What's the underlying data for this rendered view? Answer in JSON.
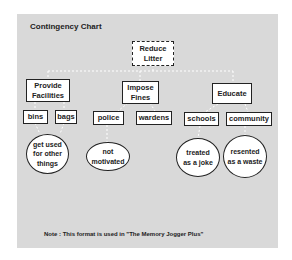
{
  "chart_title": "Contingency Chart",
  "root": {
    "label": "Reduce Litter"
  },
  "branches": [
    {
      "label": "Provide Facilities",
      "children": [
        {
          "label": "bins",
          "consequence": "get used for other things"
        },
        {
          "label": "bags",
          "consequence": null
        }
      ]
    },
    {
      "label": "Impose Fines",
      "children": [
        {
          "label": "police",
          "consequence": "not motivated"
        },
        {
          "label": "wardens",
          "consequence": null
        }
      ]
    },
    {
      "label": "Educate",
      "children": [
        {
          "label": "schools",
          "consequence": "treated as a joke"
        },
        {
          "label": "community",
          "consequence": "resented as a waste"
        }
      ]
    }
  ],
  "nodes": {
    "root": "Reduce Litter",
    "provide": "Provide Facilities",
    "impose": "Impose Fines",
    "educate": "Educate",
    "bins": "bins",
    "bags": "bags",
    "police": "police",
    "wardens": "wardens",
    "schools": "schools",
    "community": "community",
    "c_bins": "get used for other things",
    "c_police": "not motivated",
    "c_schools": "treated as a joke",
    "c_community": "resented as a waste"
  },
  "note": "Note : This format is used in \"The Memory Jogger Plus\"",
  "colors": {
    "panel": "#d9d9d9",
    "box": "#ffffff",
    "border": "#222222"
  }
}
